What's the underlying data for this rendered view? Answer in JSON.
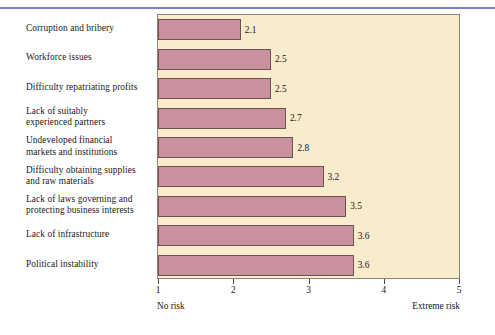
{
  "chart_data": {
    "type": "bar",
    "orientation": "horizontal",
    "title": "",
    "xlabel": "",
    "ylabel": "",
    "xlim": [
      1,
      5
    ],
    "grid": false,
    "legend": null,
    "categories": [
      "Corruption and bribery",
      "Workforce issues",
      "Difficulty repatriating profits",
      "Lack of suitably experienced partners",
      "Undeveloped financial markets and institutions",
      "Difficulty obtaining supplies and raw materials",
      "Lack of laws governing and protecting business interests",
      "Lack of infrastructure",
      "Political instability"
    ],
    "category_lines": [
      [
        "Corruption and bribery"
      ],
      [
        "Workforce issues"
      ],
      [
        "Difficulty repatriating profits"
      ],
      [
        "Lack of suitably",
        "experienced partners"
      ],
      [
        "Undeveloped financial",
        "markets and institutions"
      ],
      [
        "Difficulty obtaining supplies",
        "and raw materials"
      ],
      [
        "Lack of laws governing and",
        "protecting business interests"
      ],
      [
        "Lack of infrastructure"
      ],
      [
        "Political instability"
      ]
    ],
    "values": [
      2.1,
      2.5,
      2.5,
      2.7,
      2.8,
      3.2,
      3.5,
      3.6,
      3.6
    ],
    "value_labels": [
      "2.1",
      "2.5",
      "2.5",
      "2.7",
      "2.8",
      "3.2",
      "3.5",
      "3.6",
      "3.6"
    ],
    "xticks": [
      1,
      2,
      3,
      4,
      5
    ],
    "xtick_labels": [
      "1",
      "2",
      "3",
      "4",
      "5"
    ],
    "axis_endpoint_labels": {
      "low": "No risk",
      "high": "Extreme risk"
    },
    "colors": {
      "bar_fill": "#c9909f",
      "bar_edge": "#6e5258",
      "plot_background": "#f9eccd",
      "plot_border": "#8e8574",
      "text": "#17171c",
      "top_rule": "#7b7fc4",
      "page_background": "#ffffff"
    }
  }
}
